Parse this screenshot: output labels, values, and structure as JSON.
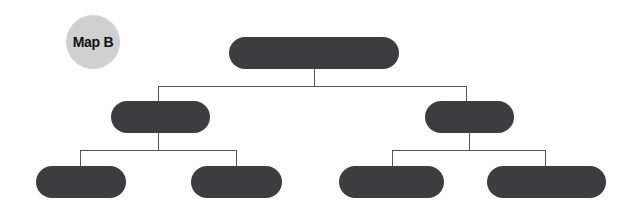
{
  "badge": {
    "label": "Map B",
    "color": "#d0d0d0"
  },
  "node_color": "#3d3d3f",
  "line_color": "#555555",
  "tree": {
    "root": {
      "label": "",
      "x": 229,
      "y": 37,
      "w": 170
    },
    "level1": [
      {
        "label": "",
        "x": 111,
        "y": 101,
        "w": 99
      },
      {
        "label": "",
        "x": 425,
        "y": 101,
        "w": 89
      }
    ],
    "level2": [
      {
        "label": "",
        "x": 36,
        "y": 166,
        "w": 90
      },
      {
        "label": "",
        "x": 191,
        "y": 166,
        "w": 91
      },
      {
        "label": "",
        "x": 339,
        "y": 166,
        "w": 105
      },
      {
        "label": "",
        "x": 487,
        "y": 166,
        "w": 119
      }
    ]
  }
}
